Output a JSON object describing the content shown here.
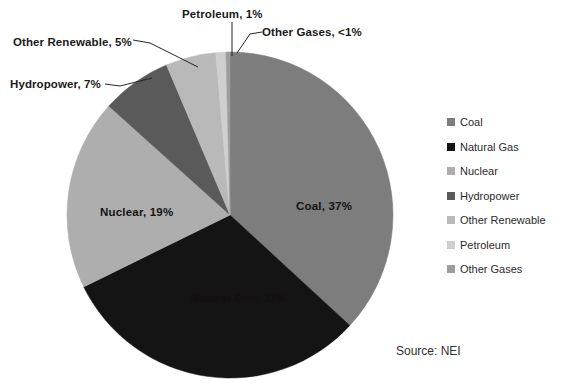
{
  "chart_data": {
    "type": "pie",
    "title": "",
    "subtitle": "",
    "xlabel": "",
    "ylabel": "",
    "legend_position": "right",
    "grid": false,
    "start_angle_deg": 0,
    "direction": "clockwise",
    "categories": [
      "Coal",
      "Natural Gas",
      "Nuclear",
      "Hydropower",
      "Other Renewable",
      "Petroleum",
      "Other Gases"
    ],
    "values": [
      37,
      31,
      19,
      7,
      5,
      1,
      0.4
    ],
    "value_labels": [
      "37%",
      "31%",
      "19%",
      "7%",
      "5%",
      "1%",
      "<1%"
    ],
    "slice_colors": [
      "#7d7d7d",
      "#141414",
      "#aeaeae",
      "#5a5a5a",
      "#b9b9b9",
      "#cfcfcf",
      "#9d9d9d"
    ],
    "annotations": [
      "Source: NEI"
    ]
  },
  "pie": {
    "center_x": 230,
    "center_y": 215,
    "radius": 163,
    "slices": [
      {
        "name": "Coal",
        "label": "Coal, 37%",
        "percent": "37%",
        "value": 37,
        "color": "#7d7d7d",
        "label_placement": "inside",
        "label_x": 296,
        "label_y": 200,
        "label_tone": "on-light"
      },
      {
        "name": "Natural Gas",
        "label": "Natural Gas, 31%",
        "percent": "31%",
        "value": 31,
        "color": "#141414",
        "label_placement": "inside",
        "label_x": 190,
        "label_y": 292,
        "label_tone": "on-dark"
      },
      {
        "name": "Nuclear",
        "label": "Nuclear, 19%",
        "percent": "19%",
        "value": 19,
        "color": "#aeaeae",
        "label_placement": "inside",
        "label_x": 100,
        "label_y": 206,
        "label_tone": "on-light"
      },
      {
        "name": "Hydropower",
        "label": "Hydropower, 7%",
        "percent": "7%",
        "value": 7,
        "color": "#5a5a5a",
        "label_placement": "callout",
        "label_x": 10,
        "label_y": 78
      },
      {
        "name": "Other Renewable",
        "label": "Other Renewable, 5%",
        "percent": "5%",
        "value": 5,
        "color": "#b9b9b9",
        "label_placement": "callout",
        "label_x": 13,
        "label_y": 36
      },
      {
        "name": "Petroleum",
        "label": "Petroleum, 1%",
        "percent": "1%",
        "value": 1,
        "color": "#cfcfcf",
        "label_placement": "callout",
        "label_x": 182,
        "label_y": 8
      },
      {
        "name": "Other Gases",
        "label": "Other Gases, <1%",
        "percent": "<1%",
        "value": 0.4,
        "color": "#9d9d9d",
        "label_placement": "callout",
        "label_x": 262,
        "label_y": 26
      }
    ]
  },
  "legend": {
    "items": [
      {
        "label": "Coal",
        "color": "#7d7d7d"
      },
      {
        "label": "Natural Gas",
        "color": "#141414"
      },
      {
        "label": "Nuclear",
        "color": "#aeaeae"
      },
      {
        "label": "Hydropower",
        "color": "#5a5a5a"
      },
      {
        "label": "Other Renewable",
        "color": "#b9b9b9"
      },
      {
        "label": "Petroleum",
        "color": "#cfcfcf"
      },
      {
        "label": "Other Gases",
        "color": "#9d9d9d"
      }
    ]
  },
  "footer": {
    "source": "Source: NEI"
  }
}
